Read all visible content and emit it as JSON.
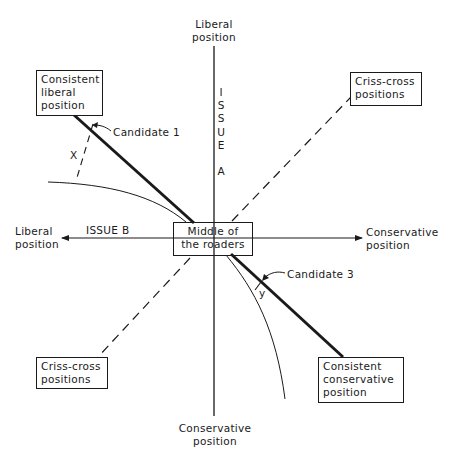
{
  "diagram": {
    "axes": {
      "issue_a": {
        "label": "I\nS\nS\nU\nE\n\nA",
        "top_label": "Liberal\nposition",
        "bottom_label": "Conservative\nposition"
      },
      "issue_b": {
        "label": "ISSUE B",
        "left_label": "Liberal\nposition",
        "right_label": "Conservative\nposition"
      }
    },
    "boxes": {
      "consistent_liberal": "Consistent\nliberal\nposition",
      "criss_cross_top_right": "Criss-cross\npositions",
      "middle_of_the_road": "Middle of\nthe roaders",
      "criss_cross_bottom_left": "Criss-cross\npositions",
      "consistent_conservative": "Consistent\nconservative\nposition"
    },
    "annotations": {
      "candidate_1": "Candidate 1",
      "candidate_3": "Candidate 3",
      "distance_x": "X",
      "distance_y": "y"
    },
    "colors": {
      "ink": "#1a1a1a",
      "background": "#ffffff"
    }
  }
}
